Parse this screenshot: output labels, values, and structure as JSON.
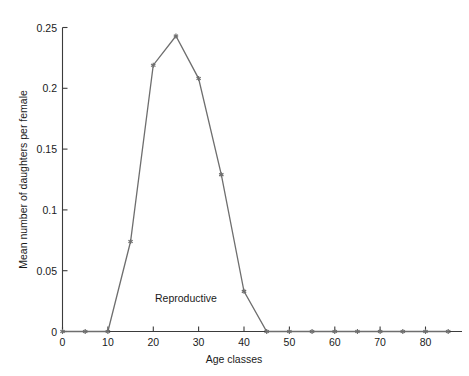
{
  "chart_data": {
    "type": "line",
    "title": "",
    "subtitle": "",
    "xlabel": "Age classes",
    "ylabel": "Mean number of daughters per female",
    "xlim": [
      0,
      88
    ],
    "ylim": [
      0,
      0.25
    ],
    "grid": false,
    "legend": null,
    "legend_position": "none",
    "x_ticks": [
      0,
      10,
      20,
      30,
      40,
      50,
      60,
      70,
      80
    ],
    "x_tick_labels": [
      "0",
      "10",
      "20",
      "30",
      "40",
      "50",
      "60",
      "70",
      "80"
    ],
    "y_ticks": [
      0,
      0.05,
      0.1,
      0.15,
      0.2,
      0.25
    ],
    "y_tick_labels": [
      "0",
      "0.05",
      "0.1",
      "0.15",
      "0.2",
      "0.25"
    ],
    "series": [
      {
        "name": "Mean number of daughters per female",
        "color": "#6e6e6e",
        "marker": "star",
        "x": [
          0,
          5,
          10,
          15,
          20,
          25,
          30,
          35,
          40,
          45,
          50,
          55,
          60,
          65,
          70,
          75,
          80,
          85
        ],
        "values": [
          0,
          0,
          0,
          0.074,
          0.219,
          0.243,
          0.208,
          0.129,
          0.033,
          0,
          0,
          0,
          0,
          0,
          0,
          0,
          0,
          0
        ]
      }
    ],
    "annotations": [
      {
        "text": "Reproductive",
        "x": 20.5,
        "y": 0.0255
      }
    ]
  },
  "figure": {
    "background_color": "#ffffff",
    "axis_color": "#3b3b3b",
    "text_color": "#1a1a1a",
    "series_color": "#6e6e6e"
  }
}
